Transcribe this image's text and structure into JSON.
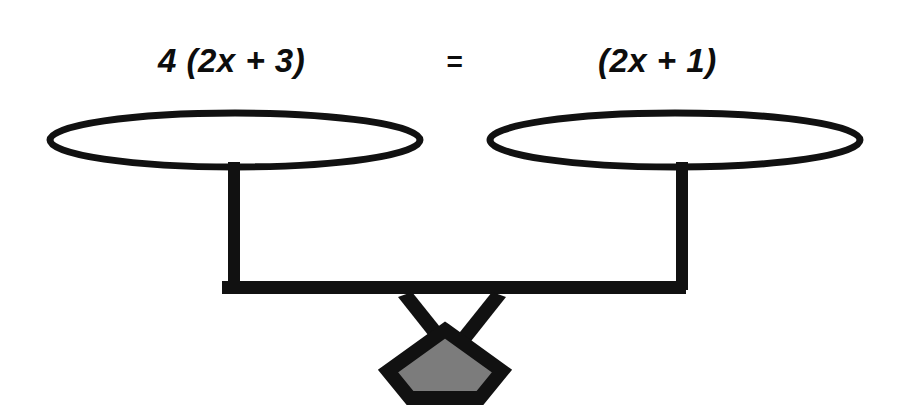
{
  "diagram": {
    "type": "balance-scale",
    "equation": {
      "left_expression": "4 (2x + 3)",
      "operator": "=",
      "right_expression": "(2x + 1)",
      "full": "4 (2x + 3) = (2x + 1)"
    },
    "colors": {
      "stroke": "#111111",
      "pan_fill": "#ffffff",
      "base_fill": "#7c7c7c",
      "background": "#ffffff"
    },
    "parts": {
      "left_pan_label": "left-pan",
      "right_pan_label": "right-pan",
      "left_post_label": "left-post",
      "right_post_label": "right-post",
      "beam_label": "balance-beam",
      "fulcrum_label": "fulcrum",
      "base_label": "pentagon-base"
    },
    "geometry": {
      "left_pan": {
        "cx": 235,
        "cy": 140,
        "rx": 185,
        "ry": 27
      },
      "right_pan": {
        "cx": 675,
        "cy": 140,
        "rx": 185,
        "ry": 27
      },
      "beam": {
        "x": 222,
        "y": 281,
        "width": 464,
        "height": 13
      },
      "base": {
        "cx": 445,
        "cy": 364,
        "radius": 58
      }
    }
  }
}
